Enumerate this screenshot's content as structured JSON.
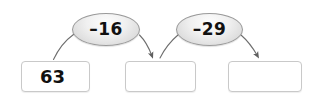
{
  "diagram": {
    "type": "arrow-chain-subtraction",
    "background_color": "#ffffff",
    "stroke_color": "#6e6e6e",
    "bubble_fill": "#e8e8e8",
    "bubble_border": "#9a9a9a",
    "box_border": "#c9c9c9",
    "text_color": "#111111"
  },
  "operations": [
    {
      "label": "–16",
      "name": "operation-minus-16"
    },
    {
      "label": "–29",
      "name": "operation-minus-29"
    }
  ],
  "boxes": [
    {
      "value": "63",
      "name": "value-box-start",
      "filled": true
    },
    {
      "value": "",
      "name": "value-box-answer-1",
      "filled": false
    },
    {
      "value": "",
      "name": "value-box-answer-2",
      "filled": false
    }
  ]
}
